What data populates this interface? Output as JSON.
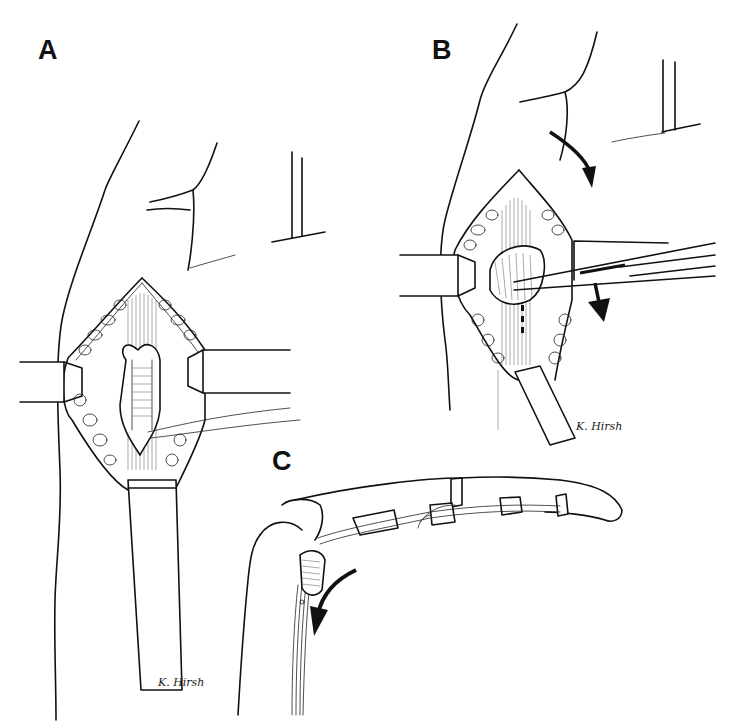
{
  "figure": {
    "panels": [
      {
        "id": "A",
        "label": "A",
        "signature": "K. Hirsh"
      },
      {
        "id": "B",
        "label": "B",
        "signature": "K. Hirsh"
      },
      {
        "id": "C",
        "label": "C"
      }
    ],
    "arrows": {
      "B": [
        "curved-arrow-down",
        "straight-arrow-down"
      ],
      "C": [
        "curved-arrow-down-left"
      ]
    },
    "colors": {
      "ink": "#111111",
      "background": "#ffffff"
    }
  }
}
